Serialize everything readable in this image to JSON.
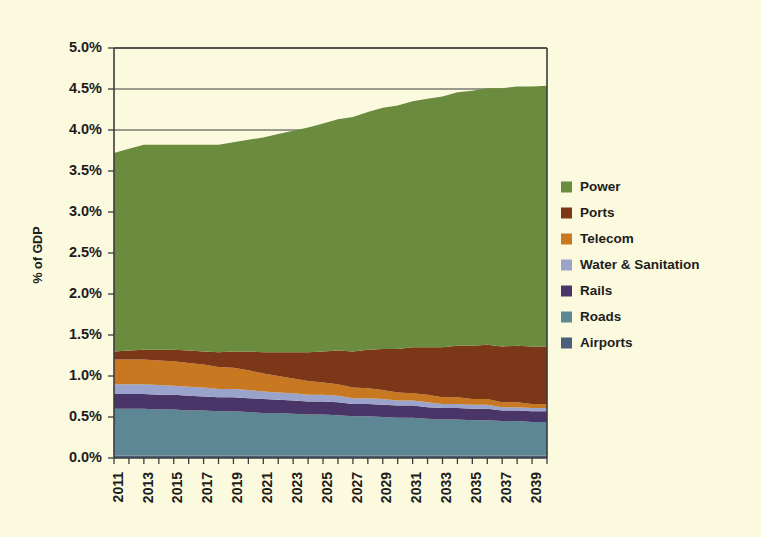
{
  "chart_data": {
    "type": "area",
    "stacked": true,
    "title": "",
    "xlabel": "",
    "ylabel": "% of GDP",
    "ylim": [
      0,
      5
    ],
    "ytick_labels": [
      "0.0%",
      "0.5%",
      "1.0%",
      "1.5%",
      "2.0%",
      "2.5%",
      "3.0%",
      "3.5%",
      "4.0%",
      "4.5%",
      "5.0%"
    ],
    "ytick_values": [
      0,
      0.5,
      1.0,
      1.5,
      2.0,
      2.5,
      3.0,
      3.5,
      4.0,
      4.5,
      5.0
    ],
    "grid": "horizontal-major-only",
    "legend_position": "right",
    "x": [
      2011,
      2012,
      2013,
      2014,
      2015,
      2016,
      2017,
      2018,
      2019,
      2020,
      2021,
      2022,
      2023,
      2024,
      2025,
      2026,
      2027,
      2028,
      2029,
      2030,
      2031,
      2032,
      2033,
      2034,
      2035,
      2036,
      2037,
      2038,
      2039,
      2040
    ],
    "xtick_labels": [
      "2011",
      "2013",
      "2015",
      "2017",
      "2019",
      "2021",
      "2023",
      "2025",
      "2027",
      "2029",
      "2031",
      "2033",
      "2035",
      "2037",
      "2039"
    ],
    "xtick_values": [
      2011,
      2013,
      2015,
      2017,
      2019,
      2021,
      2023,
      2025,
      2027,
      2029,
      2031,
      2033,
      2035,
      2037,
      2039
    ],
    "stack_order_bottom_to_top": [
      "Airports",
      "Roads",
      "Rails",
      "Water & Sanitation",
      "Telecom",
      "Ports",
      "Power"
    ],
    "series": [
      {
        "name": "Power",
        "color": "#6b8c3e",
        "values": [
          2.42,
          2.46,
          2.5,
          2.5,
          2.5,
          2.51,
          2.52,
          2.53,
          2.55,
          2.58,
          2.62,
          2.66,
          2.7,
          2.74,
          2.78,
          2.82,
          2.86,
          2.9,
          2.94,
          2.97,
          3.0,
          3.03,
          3.06,
          3.09,
          3.11,
          3.13,
          3.15,
          3.16,
          3.17,
          3.18
        ]
      },
      {
        "name": "Ports",
        "color": "#7c3618",
        "values": [
          0.1,
          0.11,
          0.12,
          0.13,
          0.14,
          0.15,
          0.16,
          0.18,
          0.2,
          0.23,
          0.26,
          0.29,
          0.32,
          0.35,
          0.38,
          0.41,
          0.44,
          0.47,
          0.5,
          0.53,
          0.56,
          0.58,
          0.61,
          0.63,
          0.65,
          0.66,
          0.68,
          0.69,
          0.7,
          0.7
        ]
      },
      {
        "name": "Telecom",
        "color": "#c87820",
        "values": [
          0.3,
          0.3,
          0.3,
          0.3,
          0.3,
          0.29,
          0.28,
          0.27,
          0.26,
          0.24,
          0.22,
          0.2,
          0.18,
          0.17,
          0.15,
          0.14,
          0.13,
          0.12,
          0.11,
          0.1,
          0.09,
          0.09,
          0.08,
          0.08,
          0.07,
          0.07,
          0.06,
          0.06,
          0.05,
          0.05
        ]
      },
      {
        "name": "Water & Sanitation",
        "color": "#9aa3cc",
        "values": [
          0.12,
          0.12,
          0.12,
          0.12,
          0.11,
          0.11,
          0.11,
          0.1,
          0.1,
          0.1,
          0.09,
          0.09,
          0.09,
          0.08,
          0.08,
          0.08,
          0.07,
          0.07,
          0.07,
          0.06,
          0.06,
          0.06,
          0.05,
          0.05,
          0.05,
          0.05,
          0.04,
          0.04,
          0.04,
          0.04
        ]
      },
      {
        "name": "Rails",
        "color": "#4a3568",
        "values": [
          0.18,
          0.18,
          0.18,
          0.18,
          0.18,
          0.18,
          0.17,
          0.17,
          0.17,
          0.17,
          0.17,
          0.16,
          0.16,
          0.16,
          0.16,
          0.16,
          0.15,
          0.15,
          0.15,
          0.15,
          0.15,
          0.14,
          0.14,
          0.14,
          0.14,
          0.14,
          0.13,
          0.13,
          0.13,
          0.13
        ]
      },
      {
        "name": "Roads",
        "color": "#5d8795",
        "values": [
          0.57,
          0.57,
          0.57,
          0.56,
          0.56,
          0.55,
          0.55,
          0.54,
          0.54,
          0.53,
          0.52,
          0.52,
          0.51,
          0.5,
          0.5,
          0.49,
          0.48,
          0.48,
          0.47,
          0.46,
          0.46,
          0.45,
          0.44,
          0.44,
          0.43,
          0.43,
          0.42,
          0.42,
          0.41,
          0.41
        ]
      },
      {
        "name": "Airports",
        "color": "#4a5f7a",
        "values": [
          0.03,
          0.03,
          0.03,
          0.03,
          0.03,
          0.03,
          0.03,
          0.03,
          0.03,
          0.03,
          0.03,
          0.03,
          0.03,
          0.03,
          0.03,
          0.03,
          0.03,
          0.03,
          0.03,
          0.03,
          0.03,
          0.03,
          0.03,
          0.03,
          0.03,
          0.03,
          0.03,
          0.03,
          0.03,
          0.03
        ]
      }
    ],
    "totals": [
      3.72,
      3.77,
      3.82,
      3.82,
      3.82,
      3.82,
      3.82,
      3.82,
      3.85,
      3.88,
      3.91,
      3.95,
      3.99,
      4.03,
      4.08,
      4.13,
      4.16,
      4.22,
      4.27,
      4.3,
      4.35,
      4.38,
      4.41,
      4.46,
      4.48,
      4.51,
      4.51,
      4.53,
      4.53,
      4.54
    ]
  },
  "legend": {
    "items": [
      {
        "label": "Power",
        "color": "#6b8c3e"
      },
      {
        "label": "Ports",
        "color": "#7c3618"
      },
      {
        "label": "Telecom",
        "color": "#c87820"
      },
      {
        "label": "Water & Sanitation",
        "color": "#9aa3cc"
      },
      {
        "label": "Rails",
        "color": "#4a3568"
      },
      {
        "label": "Roads",
        "color": "#5d8795"
      },
      {
        "label": "Airports",
        "color": "#4a5f7a"
      }
    ]
  }
}
